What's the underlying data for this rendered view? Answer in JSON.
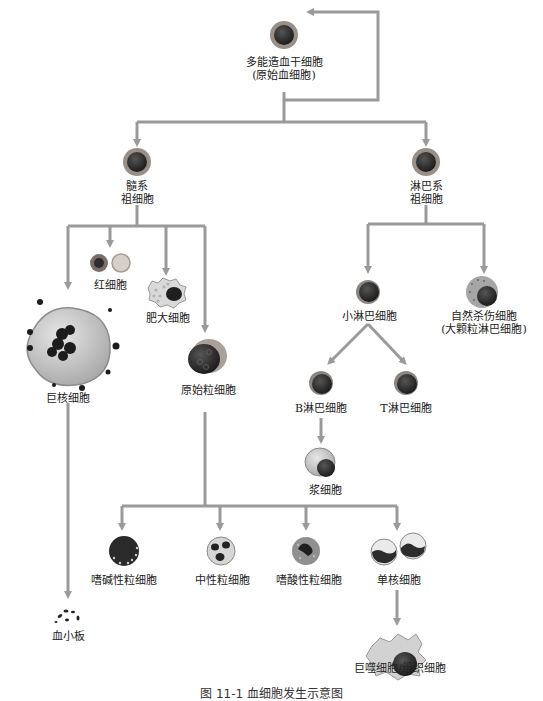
{
  "title": "血细胞发生示意图",
  "colors": {
    "line": "#9a9a9a",
    "nucleus": "#2a2a2a",
    "cell_ring": "#8f8f8f",
    "cytoplasm": "#c9c9c9"
  },
  "nodes": {
    "stem": {
      "label1": "多能造血干细胞",
      "label2": "(原始血细胞)"
    },
    "myeloid": {
      "label1": "髓系",
      "label2": "祖细胞"
    },
    "lymphoid": {
      "label1": "淋巴系",
      "label2": "祖细胞"
    },
    "rbc": {
      "label": "红细胞"
    },
    "mast": {
      "label": "肥大细胞"
    },
    "megakaryocyte": {
      "label": "巨核细胞"
    },
    "myeloblast": {
      "label": "原始粒细胞"
    },
    "small_lymph": {
      "label": "小淋巴细胞"
    },
    "nk": {
      "label1": "自然杀伤细胞",
      "label2": "(大颗粒淋巴细胞)"
    },
    "b_cell": {
      "label": "B淋巴细胞"
    },
    "t_cell": {
      "label": "T淋巴细胞"
    },
    "plasma": {
      "label": "浆细胞"
    },
    "basophil": {
      "label": "嗜碱性粒细胞"
    },
    "neutrophil": {
      "label": "中性粒细胞"
    },
    "eosinophil": {
      "label": "嗜酸性粒细胞"
    },
    "monocyte": {
      "label": "单核细胞"
    },
    "macrophage": {
      "label": "巨噬细胞/组织细胞"
    },
    "platelet": {
      "label": "血小板"
    }
  },
  "caption": "图 11-1 血细胞发生示意图"
}
